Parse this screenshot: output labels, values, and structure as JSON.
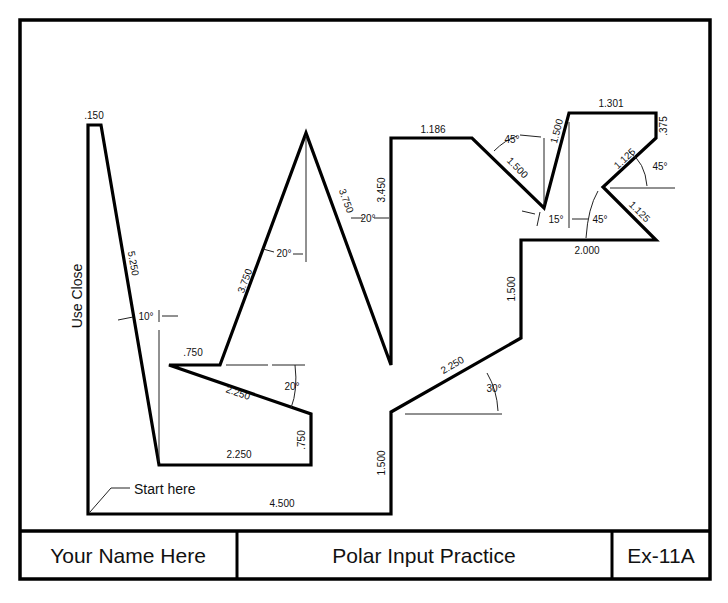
{
  "title_block": {
    "name": "Your Name Here",
    "title": "Polar Input Practice",
    "exercise": "Ex-11A"
  },
  "notes": {
    "use_close": "Use Close",
    "start_here": "Start here"
  },
  "dimensions": {
    "d_150": ".150",
    "d_5250": "5.250",
    "a_10": "10°",
    "d_750_top": ".750",
    "d_3750_left": "3.750",
    "a_20_apex": "20°",
    "d_3750_right": "3.750",
    "a_20_right": "20°",
    "d_3450": "3.450",
    "d_1186": "1.186",
    "a_45_top": "45°",
    "d_1500_diag": "1.500",
    "d_1500_steep": "1.500",
    "a_15": "15°",
    "d_1301": "1.301",
    "d_375": ".375",
    "d_1125_upper": "1.125",
    "a_45_right": "45°",
    "d_1125_lower": "1.125",
    "a_45_lower": "45°",
    "d_2000": "2.000",
    "d_1500_mid": "1.500",
    "d_2250_slope": "2.250",
    "a_30": "30°",
    "d_2250_incline": "2.250",
    "a_20_incline": "20°",
    "d_750_right": ".750",
    "d_2250_bottom": "2.250",
    "d_1500_bottom": "1.500",
    "d_4500": "4.500"
  }
}
